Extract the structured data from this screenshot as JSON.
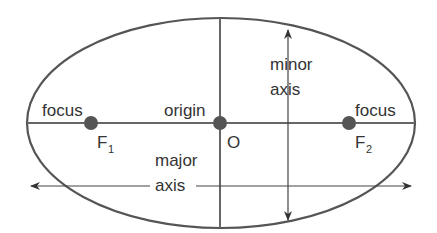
{
  "diagram": {
    "labels": {
      "focus_left": "focus",
      "focus_right": "focus",
      "origin": "origin",
      "origin_point": "O",
      "f1_main": "F",
      "f1_sub": "1",
      "f2_main": "F",
      "f2_sub": "2",
      "minor_line1": "minor",
      "minor_line2": "axis",
      "major_line1": "major",
      "major_line2": "axis"
    },
    "colors": {
      "stroke": "#555555",
      "point": "#555555",
      "text": "#333333"
    }
  }
}
